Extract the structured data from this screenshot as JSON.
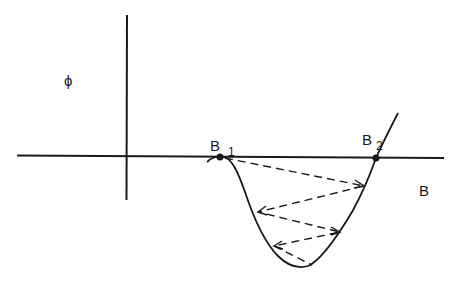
{
  "diagram": {
    "y_axis_label": "ϕ",
    "x_axis_label": "B",
    "points": [
      {
        "name": "B",
        "subscript": "1"
      },
      {
        "name": "B",
        "subscript": "2"
      }
    ],
    "colors": {
      "stroke": "#1a1a1a",
      "background": "#ffffff"
    },
    "elements": {
      "curve": "potential well curve dipping below B axis between B1 and B2",
      "zigzag": "dashed zigzag path bouncing between the walls of the well"
    }
  }
}
